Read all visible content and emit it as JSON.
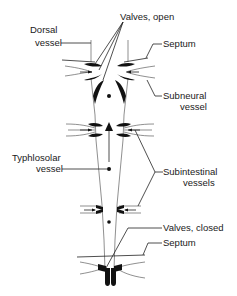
{
  "diagram": {
    "type": "anatomical-schematic",
    "labels": {
      "valves_open": "Valves, open",
      "dorsal_vessel_1": "Dorsal",
      "dorsal_vessel_2": "vessel",
      "septum_top": "Septum",
      "subneural_1": "Subneural",
      "subneural_2": "vessel",
      "typhlosolar_1": "Typhlosolar",
      "typhlosolar_2": "vessel",
      "subintestinal_1": "Subintestinal",
      "subintestinal_2": "vessels",
      "valves_closed": "Valves, closed",
      "septum_bottom": "Septum"
    },
    "colors": {
      "ink": "#111111",
      "background": "#ffffff"
    }
  }
}
